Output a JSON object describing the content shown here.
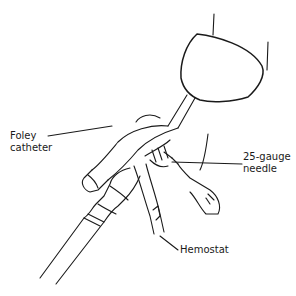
{
  "figure": {
    "labels": {
      "foley": {
        "line1": "Foley",
        "line2": "catheter"
      },
      "needle": {
        "line1": "25-gauge",
        "line2": "needle"
      },
      "hemostat": {
        "text": "Hemostat"
      }
    },
    "colors": {
      "stroke": "#1a1a1a",
      "background": "#ffffff"
    }
  }
}
